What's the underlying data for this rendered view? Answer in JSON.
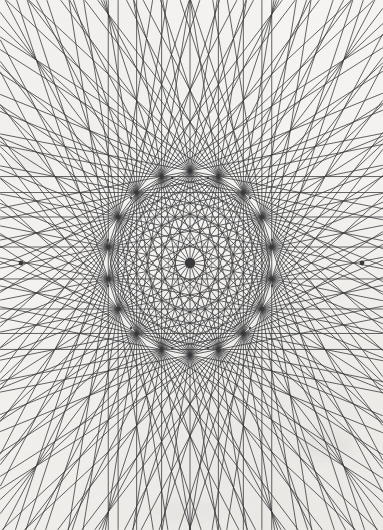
{
  "canvas": {
    "width": 383,
    "height": 530,
    "background_color": "#f6f5f3",
    "ink_color": "#3a3a3c",
    "title": "Radial chord star figure"
  },
  "figure": {
    "name": "complete-chord-star",
    "center": {
      "x": 190,
      "y": 263
    },
    "vertex_count": 18,
    "ring": {
      "radius_x": 83,
      "radius_y": 92,
      "rotation_deg": 90
    },
    "line": {
      "stroke_width": 0.85,
      "opacity": 0.92,
      "extend": true,
      "extend_mode": "to-canvas-bounds"
    },
    "node": {
      "outer_radius": 2.1,
      "inner_radius": 1.2,
      "hub_radius": 5.2
    },
    "inner_rings": [
      {
        "radius_x": 44,
        "radius_y": 49,
        "vertex_count": 18
      },
      {
        "radius_x": 22,
        "radius_y": 25,
        "vertex_count": 18
      }
    ],
    "edge_vertices": [
      {
        "x": 21,
        "y": 263,
        "label": "left-apex"
      },
      {
        "x": 362,
        "y": 263,
        "label": "right-apex"
      }
    ],
    "major_vertices": [
      {
        "x": 172,
        "y": 178
      },
      {
        "x": 208,
        "y": 178
      },
      {
        "x": 131,
        "y": 198
      },
      {
        "x": 250,
        "y": 198
      },
      {
        "x": 108,
        "y": 240
      },
      {
        "x": 272,
        "y": 240
      },
      {
        "x": 108,
        "y": 286
      },
      {
        "x": 272,
        "y": 286
      },
      {
        "x": 131,
        "y": 328
      },
      {
        "x": 250,
        "y": 328
      },
      {
        "x": 172,
        "y": 348
      },
      {
        "x": 208,
        "y": 348
      }
    ]
  },
  "chart_data": {
    "type": "scatter",
    "xlabel": "",
    "ylabel": "",
    "xlim": [
      0,
      383
    ],
    "ylim": [
      0,
      530
    ],
    "grid": false,
    "legend": "none",
    "series": [
      {
        "name": "polygon-vertices",
        "note": "18 vertices of an ellipse centred at (190,263), rx=83, ry=92, first vertex at top",
        "x": [
          190,
          218,
          244,
          264,
          276,
          280,
          274,
          260,
          238,
          212,
          190,
          168,
          142,
          120,
          106,
          100,
          104,
          116,
          140,
          166
        ],
        "y": [
          171,
          174,
          184,
          201,
          222,
          247,
          273,
          297,
          318,
          333,
          355,
          352,
          342,
          325,
          304,
          279,
          253,
          228,
          207,
          187
        ]
      }
    ]
  }
}
